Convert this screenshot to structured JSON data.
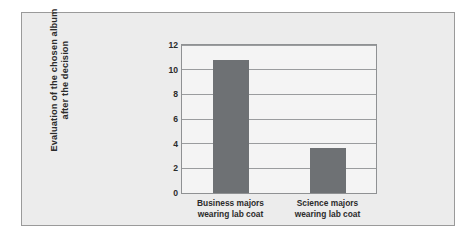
{
  "figure": {
    "panel_background": "#ececec",
    "panel_border": "#9a9a9a",
    "plot_background": "#f4f4f4"
  },
  "chart_data": {
    "type": "bar",
    "title": "",
    "subtitle": "",
    "xlabel": "",
    "ylabel": "Evaluation of the chosen album after the decision",
    "ylabel_line1": "Evaluation of the chosen album",
    "ylabel_line2": "after the decision",
    "categories": [
      "Business majors wearing lab coat",
      "Science majors wearing lab coat"
    ],
    "category_lines": [
      [
        "Business majors",
        "wearing lab coat"
      ],
      [
        "Science majors",
        "wearing lab coat"
      ]
    ],
    "values": [
      10.8,
      3.65
    ],
    "ylim": [
      0,
      12
    ],
    "ytick_step": 2,
    "yticks": [
      0,
      2,
      4,
      6,
      8,
      10,
      12
    ],
    "ytick_labels": [
      "0",
      "2",
      "4",
      "6",
      "8",
      "10",
      "12"
    ],
    "grid": true,
    "grid_axis": "y",
    "grid_color": "#9a9c9e",
    "legend": false,
    "legend_position": "none",
    "bar_color": "#6e7174",
    "bar_edge_color": "#6e7174"
  }
}
